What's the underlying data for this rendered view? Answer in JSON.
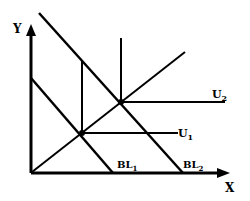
{
  "diagram": {
    "type": "indifference-curve-budget-line",
    "axes": {
      "x_label": "X",
      "y_label": "Y"
    },
    "budget_lines": [
      {
        "label": "BL",
        "sub": "1"
      },
      {
        "label": "BL",
        "sub": "2"
      }
    ],
    "utility_curves": [
      {
        "label": "U",
        "sub": "1"
      },
      {
        "label": "U",
        "sub": "2"
      }
    ],
    "colors": {
      "line": "#000000",
      "background": "#ffffff"
    }
  }
}
